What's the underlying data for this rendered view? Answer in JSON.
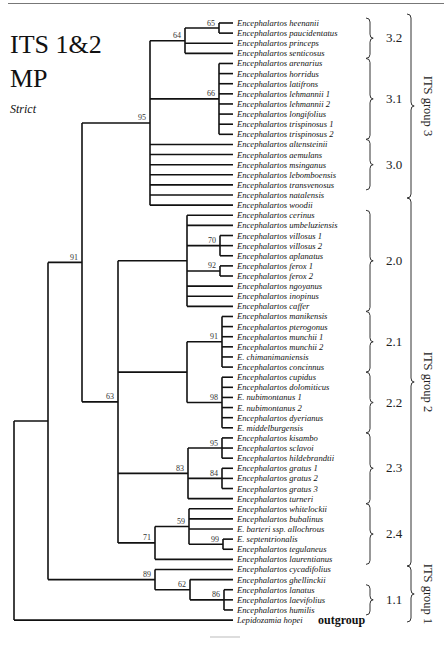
{
  "title": {
    "line1": "ITS 1&2",
    "line2": "MP",
    "method": "Strict"
  },
  "tree": {
    "leaf_x": 233,
    "leaf_y0": 23,
    "leaf_dy": 10.12,
    "leaves": [
      "Encephalartos heenanii",
      "Encephalartos paucidentatus",
      "Encephalartos princeps",
      "Encephalartos senticosus",
      "Encephalartos arenarius",
      "Encephalartos horridus",
      "Encephalartos latifrons",
      "Encephalartos lehmannii 1",
      "Encephalartos lehmannii 2",
      "Encephalartos longifolius",
      "Encephalartos trispinosus 1",
      "Encephalartos trispinosus 2",
      "Encephalartos altensteinii",
      "Encephalartos aemulans",
      "Encephalartos msinganus",
      "Encephalartos lebomboensis",
      "Encephalartos transvenosus",
      "Encephalartos natalensis",
      "Encephalartos woodii",
      "Encephalartos cerinus",
      "Encephalartos umbeluziensis",
      "Encephalartos villosus 1",
      "Encephalartos villosus 2",
      "Encephalartos aplanatus",
      "Encephalartos ferox 1",
      "Encephalartos ferox 2",
      "Encephalartos ngoyanus",
      "Encephalartos inopinus",
      "Encephalartos caffer",
      "Encephalartos manikensis",
      "Encephalartos pterogonus",
      "Encephalartos munchii 1",
      "Encephalartos munchii 2",
      "E. chimanimaniensis",
      "Encephalartos concinnus",
      "Encephalartos cupidus",
      "Encephalartos dolomiticus",
      "E. nubimontanus 1",
      "E. nubimontanus 2",
      "Encephalartos dyerianus",
      "E. middelburgensis",
      "Encephalartos kisambo",
      "Encephalartos sclavoi",
      "Encephalartos hildebrandtii",
      "Encephalartos gratus 1",
      "Encephalartos gratus 2",
      "Encephalartos gratus 3",
      "Encephalartos turneri",
      "Encephalartos whitelockii",
      "Encephalartos bubalinus",
      "E. barteri ssp. allochrous",
      "E. septentrionalis",
      "Encephalartos tegulaneus",
      "Encephalartos laurentianus",
      "Encephalartos cycadifolius",
      "Encephalartos ghellinckii",
      "Encephalartos lanatus",
      "Encephalartos laevifolius",
      "Encephalartos humilis",
      "Lepidozamia hopei"
    ],
    "nodes": [
      {
        "id": "n65",
        "x": 219,
        "children": [
          0,
          1
        ],
        "support": "65"
      },
      {
        "id": "n64",
        "x": 185,
        "children": [
          "n65",
          2,
          3
        ],
        "support": "64"
      },
      {
        "id": "n66",
        "x": 219,
        "children": [
          4,
          5,
          6,
          7,
          8,
          9,
          10,
          11
        ],
        "support": "66"
      },
      {
        "id": "n95",
        "x": 150,
        "children": [
          "n64",
          "n66",
          12,
          13,
          14,
          15,
          16,
          17,
          18
        ],
        "support": "95"
      },
      {
        "id": "n70",
        "x": 220,
        "children": [
          21,
          22,
          23
        ],
        "support": "70"
      },
      {
        "id": "n92",
        "x": 220,
        "children": [
          24,
          25
        ],
        "support": "92"
      },
      {
        "id": "nG20",
        "x": 187,
        "children": [
          19,
          20,
          "n70",
          "n92",
          26,
          27,
          28
        ],
        "support": ""
      },
      {
        "id": "n91b",
        "x": 222,
        "children": [
          29,
          30,
          31,
          32,
          33,
          34
        ],
        "support": "91"
      },
      {
        "id": "n98",
        "x": 222,
        "children": [
          35,
          36,
          37,
          38,
          39,
          40
        ],
        "support": "98"
      },
      {
        "id": "nG21",
        "x": 187,
        "children": [
          "n91b",
          "n98"
        ],
        "support": ""
      },
      {
        "id": "n95b",
        "x": 222,
        "children": [
          41,
          42,
          43
        ],
        "support": "95"
      },
      {
        "id": "n84",
        "x": 222,
        "children": [
          44,
          45,
          46
        ],
        "support": "84"
      },
      {
        "id": "n83",
        "x": 188,
        "children": [
          "n95b",
          "n84",
          47
        ],
        "support": "83"
      },
      {
        "id": "n99",
        "x": 223,
        "children": [
          51,
          52
        ],
        "support": "99"
      },
      {
        "id": "n59",
        "x": 189,
        "children": [
          48,
          49,
          50,
          "n99"
        ],
        "support": "59"
      },
      {
        "id": "n71",
        "x": 155,
        "children": [
          "n59",
          53
        ],
        "support": "71"
      },
      {
        "id": "n63",
        "x": 118,
        "children": [
          "nG20",
          "nG21",
          "n83",
          "n71"
        ],
        "support": "63"
      },
      {
        "id": "n91",
        "x": 82,
        "children": [
          "n95",
          "n63"
        ],
        "support": "91"
      },
      {
        "id": "n86",
        "x": 224,
        "children": [
          56,
          57,
          58
        ],
        "support": "86"
      },
      {
        "id": "n62",
        "x": 190,
        "children": [
          55,
          "n86"
        ],
        "support": "62"
      },
      {
        "id": "n89",
        "x": 155,
        "children": [
          54,
          "n62"
        ],
        "support": "89"
      },
      {
        "id": "ningroup",
        "x": 48,
        "children": [
          "n91",
          "n89"
        ],
        "support": ""
      },
      {
        "id": "root",
        "x": 14,
        "children": [
          "ningroup",
          59
        ],
        "support": ""
      }
    ]
  },
  "clades": [
    {
      "label": "3.2",
      "from": 0,
      "to": 3
    },
    {
      "label": "3.1",
      "from": 4,
      "to": 11
    },
    {
      "label": "3.0",
      "from": 12,
      "to": 16
    },
    {
      "label": "2.0",
      "from": 19,
      "to": 28
    },
    {
      "label": "2.1",
      "from": 29,
      "to": 34
    },
    {
      "label": "2.2",
      "from": 35,
      "to": 40
    },
    {
      "label": "2.3",
      "from": 41,
      "to": 47
    },
    {
      "label": "2.4",
      "from": 48,
      "to": 53
    },
    {
      "label": "1.1",
      "from": 56,
      "to": 58
    }
  ],
  "groups": [
    {
      "label": "ITS group 3",
      "y1": 14,
      "y2": 198
    },
    {
      "label": "ITS group 2",
      "y1": 198,
      "y2": 566
    },
    {
      "label": "ITS group 1",
      "y1": 566,
      "y2": 622
    }
  ],
  "outgroup_label": "outgroup"
}
